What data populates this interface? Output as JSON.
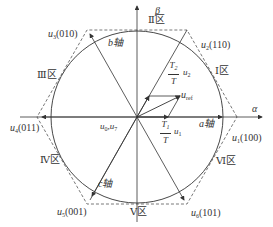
{
  "diagram": {
    "axes": {
      "alpha": "α",
      "beta": "β"
    },
    "phase_axes": {
      "a": "a轴",
      "b": "b轴",
      "c": "c轴"
    },
    "sectors": [
      {
        "id": "I",
        "label": "Ⅰ区"
      },
      {
        "id": "II",
        "label": "Ⅱ区"
      },
      {
        "id": "III",
        "label": "Ⅲ区"
      },
      {
        "id": "IV",
        "label": "Ⅳ区"
      },
      {
        "id": "V",
        "label": "Ⅴ区"
      },
      {
        "id": "VI",
        "label": "Ⅵ区"
      }
    ],
    "vectors": [
      {
        "name": "u",
        "sub": "1",
        "code": "(100)"
      },
      {
        "name": "u",
        "sub": "2",
        "code": "(110)"
      },
      {
        "name": "u",
        "sub": "3",
        "code": "(010)"
      },
      {
        "name": "u",
        "sub": "4",
        "code": "(011)"
      },
      {
        "name": "u",
        "sub": "5",
        "code": "(001)"
      },
      {
        "name": "u",
        "sub": "6",
        "code": "(101)"
      }
    ],
    "zero_vectors": {
      "label_a": "u",
      "sub_a": "0",
      "sep": ",",
      "label_b": "u",
      "sub_b": "7"
    },
    "reference": {
      "name": "u",
      "sub": "ref"
    },
    "components": [
      {
        "num": "T",
        "num_sub": "1",
        "den": "T",
        "vec": "u",
        "vec_sub": "1"
      },
      {
        "num": "T",
        "num_sub": "2",
        "den": "T",
        "vec": "u",
        "vec_sub": "2"
      }
    ],
    "colors": {
      "line": "#333333",
      "dashed": "#555555",
      "background": "#ffffff"
    }
  }
}
